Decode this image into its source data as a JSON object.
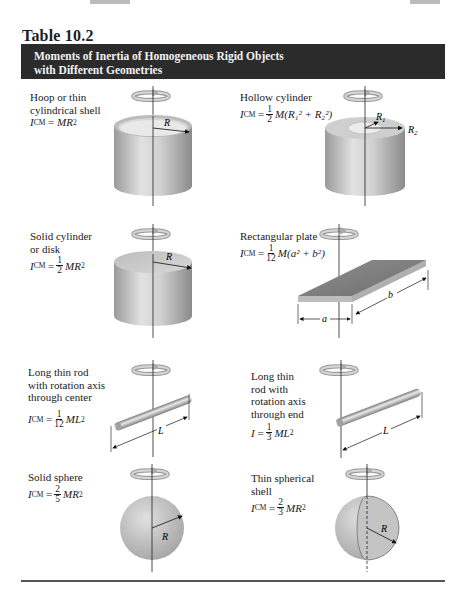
{
  "table": {
    "number": "Table 10.2",
    "title_line1": "Moments of Inertia of Homogeneous Rigid Objects",
    "title_line2": "with Different Geometries",
    "header_bg": "#2b2b2b",
    "header_fg": "#f2f2f2"
  },
  "entries": [
    {
      "id": "hoop",
      "label_lines": [
        "Hoop or thin",
        "cylindrical shell"
      ],
      "formula": {
        "lhs": "I",
        "lhs_sub": "CM",
        "eq": "=",
        "rhs": "MR",
        "rhs_sup": "2"
      },
      "figure_labels": [
        "R"
      ]
    },
    {
      "id": "hollow-cylinder",
      "label_lines": [
        "Hollow cylinder"
      ],
      "formula": {
        "lhs": "I",
        "lhs_sub": "CM",
        "eq": "=",
        "frac_num": "1",
        "frac_den": "2",
        "rhs": "M(R₁² + R₂²)"
      },
      "figure_labels": [
        "R1",
        "R2"
      ]
    },
    {
      "id": "solid-cylinder",
      "label_lines": [
        "Solid cylinder",
        "or disk"
      ],
      "formula": {
        "lhs": "I",
        "lhs_sub": "CM",
        "eq": "=",
        "frac_num": "1",
        "frac_den": "2",
        "rhs": "MR",
        "rhs_sup": "2"
      },
      "figure_labels": [
        "R"
      ]
    },
    {
      "id": "rectangular-plate",
      "label_lines": [
        "Rectangular plate"
      ],
      "formula": {
        "lhs": "I",
        "lhs_sub": "CM",
        "eq": "=",
        "frac_num": "1",
        "frac_den": "12",
        "rhs": "M(a² + b²)"
      },
      "figure_labels": [
        "a",
        "b"
      ]
    },
    {
      "id": "rod-center",
      "label_lines": [
        "Long thin rod",
        "with rotation axis",
        "through center"
      ],
      "formula": {
        "lhs": "I",
        "lhs_sub": "CM",
        "eq": "=",
        "frac_num": "1",
        "frac_den": "12",
        "rhs": "ML",
        "rhs_sup": "2"
      },
      "figure_labels": [
        "L"
      ]
    },
    {
      "id": "rod-end",
      "label_lines": [
        "Long thin",
        "rod with",
        "rotation axis",
        "through end"
      ],
      "formula": {
        "lhs": "I",
        "lhs_sub": "",
        "eq": "=",
        "frac_num": "1",
        "frac_den": "3",
        "rhs": "ML",
        "rhs_sup": "2"
      },
      "figure_labels": [
        "L"
      ]
    },
    {
      "id": "solid-sphere",
      "label_lines": [
        "Solid sphere"
      ],
      "formula": {
        "lhs": "I",
        "lhs_sub": "CM",
        "eq": "=",
        "frac_num": "2",
        "frac_den": "5",
        "rhs": "MR",
        "rhs_sup": "2"
      },
      "figure_labels": [
        "R"
      ]
    },
    {
      "id": "spherical-shell",
      "label_lines": [
        "Thin spherical",
        "shell"
      ],
      "formula": {
        "lhs": "I",
        "lhs_sub": "CM",
        "eq": "=",
        "frac_num": "2",
        "frac_den": "3",
        "rhs": "MR",
        "rhs_sup": "2"
      },
      "figure_labels": [
        "R"
      ]
    }
  ]
}
